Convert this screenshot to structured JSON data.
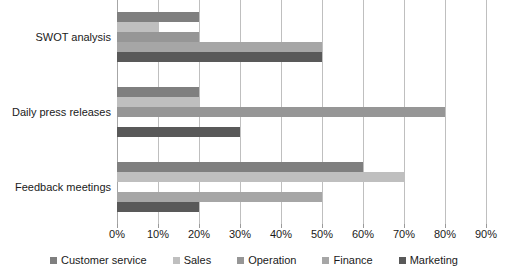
{
  "chart_data": {
    "type": "bar",
    "orientation": "horizontal",
    "title": "",
    "xlabel": "",
    "ylabel": "",
    "xlim": [
      0,
      90
    ],
    "xtick_labels": [
      "0%",
      "10%",
      "20%",
      "30%",
      "40%",
      "50%",
      "60%",
      "70%",
      "80%",
      "90%"
    ],
    "xtick_values": [
      0,
      10,
      20,
      30,
      40,
      50,
      60,
      70,
      80,
      90
    ],
    "grid": "vertical",
    "legend_position": "bottom",
    "categories": [
      "SWOT analysis",
      "Daily press releases",
      "Feedback meetings"
    ],
    "series": [
      {
        "name": "Customer service",
        "color": "#7f7f7f",
        "values": [
          20,
          20,
          60
        ]
      },
      {
        "name": "Sales",
        "color": "#bfbfbf",
        "values": [
          10,
          20,
          70
        ]
      },
      {
        "name": "Operation",
        "color": "#969696",
        "values": [
          20,
          80,
          0
        ]
      },
      {
        "name": "Finance",
        "color": "#a6a6a6",
        "values": [
          50,
          0,
          50
        ]
      },
      {
        "name": "Marketing",
        "color": "#595959",
        "values": [
          50,
          30,
          20
        ]
      }
    ]
  },
  "legend": {
    "items": [
      {
        "label": "Customer service"
      },
      {
        "label": "Sales"
      },
      {
        "label": "Operation"
      },
      {
        "label": "Finance"
      },
      {
        "label": "Marketing"
      }
    ]
  },
  "caption": {
    "text": ""
  }
}
